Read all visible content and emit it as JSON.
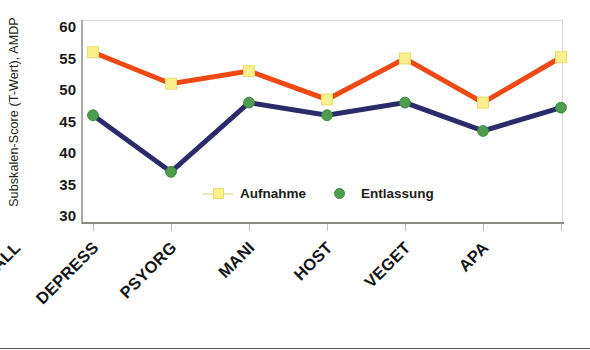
{
  "chart_data": {
    "type": "line",
    "title": "",
    "xlabel": "",
    "ylabel": "Subskalen-Score (T-Wert), AMDP",
    "ylim": [
      30,
      60
    ],
    "yticks": [
      60,
      55,
      50,
      45,
      40,
      35,
      30
    ],
    "grid": false,
    "legend_position": "inside-bottom-center",
    "categories": [
      "PARHALL",
      "DEPRESS",
      "PSYORG",
      "MANI",
      "HOST",
      "VEGET",
      "APA"
    ],
    "series": [
      {
        "name": "Aufnahme",
        "values": [
          56,
          51,
          53,
          48.5,
          55,
          48,
          55.2
        ],
        "line_color": "#EF4A16",
        "marker": "square",
        "marker_face_color": "#FAF08C",
        "marker_edge_color": "#E8DC6E"
      },
      {
        "name": "Entlassung",
        "values": [
          46,
          37,
          48,
          46,
          48,
          43.5,
          47.2
        ],
        "line_color": "#2B2B6B",
        "marker": "circle",
        "marker_face_color": "#4E9D4E",
        "marker_edge_color": "#3F8A3F"
      }
    ]
  },
  "axes": {
    "y_title": "Subskalen-Score (T-Wert), AMDP",
    "y_tick_labels": [
      "60",
      "55",
      "50",
      "45",
      "40",
      "35",
      "30"
    ],
    "x_tick_labels": [
      "PARHALL",
      "DEPRESS",
      "PSYORG",
      "MANI",
      "HOST",
      "VEGET",
      "APA"
    ]
  },
  "legend": {
    "entries": [
      {
        "label": "Aufnahme",
        "marker_name": "yellow-square-marker"
      },
      {
        "label": "Entlassung",
        "marker_name": "green-circle-marker"
      }
    ]
  },
  "colors": {
    "aufnahme_line": "#EF4A16",
    "aufnahme_marker": "#FAF08C",
    "entlassung_line": "#2B2B6B",
    "entlassung_marker": "#4E9D4E",
    "frame": "#c9c9c9",
    "text": "#1b1b1b",
    "background": "#ffffff"
  }
}
